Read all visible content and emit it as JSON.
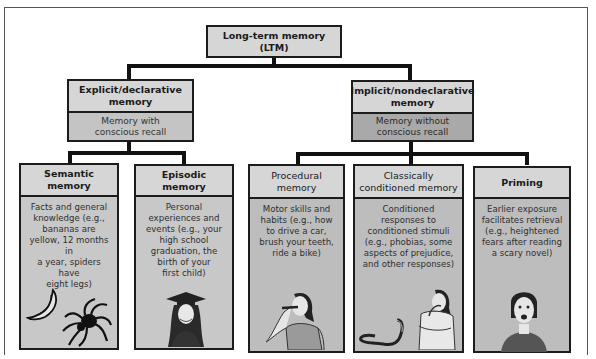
{
  "root": {
    "title": "Long-term memory (LTM)"
  },
  "branches": [
    {
      "title": "Explicit/declarative memory",
      "title_lines": [
        "Explicit/declarative",
        "memory"
      ],
      "description_lines": [
        "Memory with",
        "conscious recall"
      ],
      "children": [
        {
          "title_lines": [
            "Semantic",
            "memory"
          ],
          "description_lines": [
            "Facts and general",
            "knowledge (e.g.,",
            "bananas are",
            "yellow, 12 months in",
            "a year, spiders have",
            "eight legs)"
          ],
          "illustration": [
            "banana-icon",
            "spider-icon"
          ]
        },
        {
          "title_lines": [
            "Episodic memory"
          ],
          "description_lines": [
            "Personal",
            "experiences and",
            "events (e.g., your",
            "high school",
            "graduation, the",
            "birth of your",
            "first child)"
          ],
          "illustration": [
            "graduate-icon"
          ]
        }
      ]
    },
    {
      "title": "Implicit/nondeclarative memory",
      "title_lines": [
        "Implicit/nondeclarative",
        "memory"
      ],
      "description_lines": [
        "Memory without",
        "conscious recall"
      ],
      "children": [
        {
          "title_lines": [
            "Procedural",
            "memory"
          ],
          "description_lines": [
            "Motor skills and",
            "habits (e.g., how",
            "to drive a car,",
            "brush your teeth,",
            "ride a bike)"
          ],
          "illustration": [
            "toothbrushing-person-icon"
          ]
        },
        {
          "title_lines": [
            "Classically",
            "conditioned memory"
          ],
          "description_lines": [
            "Conditioned",
            "responses to",
            "conditioned stimuli",
            "(e.g., phobias, some",
            "aspects of prejudice,",
            "and other responses)"
          ],
          "illustration": [
            "snake-icon",
            "frightened-person-icon"
          ]
        },
        {
          "title_lines": [
            "Priming"
          ],
          "description_lines": [
            "Earlier exposure",
            "facilitates retrieval",
            "(e.g., heightened",
            "fears after reading",
            "a scary novel)"
          ],
          "illustration": [
            "scared-woman-icon"
          ]
        }
      ]
    }
  ]
}
